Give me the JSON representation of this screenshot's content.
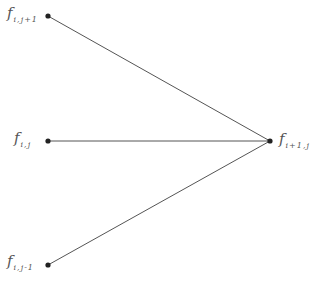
{
  "diagram": {
    "nodes": [
      {
        "id": "top",
        "label_main": "f",
        "label_sub": "i,j+1",
        "x": 48,
        "y": 16
      },
      {
        "id": "mid",
        "label_main": "f",
        "label_sub": "i,j",
        "x": 48,
        "y": 141
      },
      {
        "id": "bot",
        "label_main": "f",
        "label_sub": "i,j-1",
        "x": 48,
        "y": 265
      },
      {
        "id": "right",
        "label_main": "f",
        "label_sub": "i+1,j",
        "x": 270,
        "y": 141
      }
    ],
    "edges": [
      {
        "from": "top",
        "to": "right"
      },
      {
        "from": "mid",
        "to": "right"
      },
      {
        "from": "bot",
        "to": "right"
      }
    ],
    "colors": {
      "line": "#555555",
      "dot": "#222222",
      "label": "#555555"
    }
  }
}
